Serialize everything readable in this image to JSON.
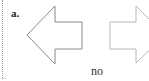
{
  "panel": {
    "label": "a.",
    "caption": "no"
  },
  "arrows": [
    {
      "name": "left-arrow",
      "direction": "left",
      "stroke": "#8a8a8a"
    },
    {
      "name": "right-arrow",
      "direction": "right",
      "stroke": "#b5b5b5"
    }
  ]
}
